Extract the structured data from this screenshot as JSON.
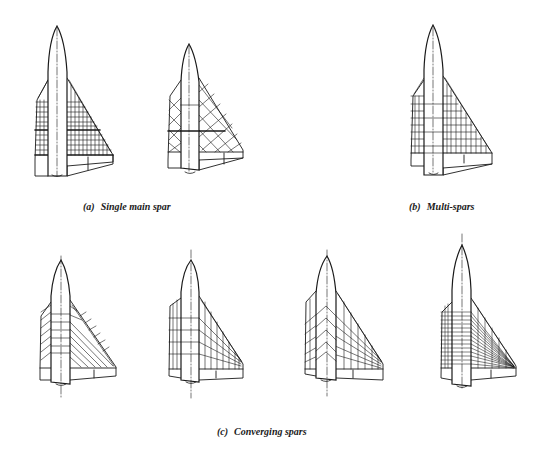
{
  "figure": {
    "groups": [
      {
        "id": "a",
        "tag": "(a)",
        "label": "Single main spar",
        "variants": 2
      },
      {
        "id": "b",
        "tag": "(b)",
        "label": "Multi-spars",
        "variants": 1
      },
      {
        "id": "c",
        "tag": "(c)",
        "label": "Converging spars",
        "variants": 4
      }
    ]
  },
  "style": {
    "line_color": "#1a1a1a",
    "background": "#ffffff"
  }
}
